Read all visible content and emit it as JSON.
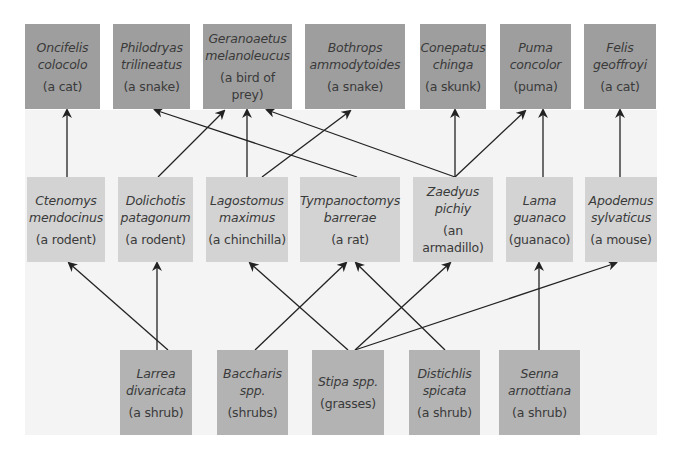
{
  "diagram": {
    "type": "food-web",
    "top_row": [
      {
        "id": "oncifelis",
        "sci1": "Oncifelis",
        "sci2": "colocolo",
        "common": "(a cat)",
        "x": 25,
        "w": 75
      },
      {
        "id": "philodryas",
        "sci1": "Philodryas",
        "sci2": "trilineatus",
        "common": "(a snake)",
        "x": 113,
        "w": 77
      },
      {
        "id": "geranoaetus",
        "sci1": "Geranoaetus",
        "sci2": "melanoleucus",
        "common": "(a bird of prey)",
        "x": 203,
        "w": 89
      },
      {
        "id": "bothrops",
        "sci1": "Bothrops",
        "sci2": "ammodytoides",
        "common": "(a snake)",
        "x": 305,
        "w": 100
      },
      {
        "id": "conepatus",
        "sci1": "Conepatus",
        "sci2": "chinga",
        "common": "(a skunk)",
        "x": 420,
        "w": 66
      },
      {
        "id": "puma",
        "sci1": "Puma",
        "sci2": "concolor",
        "common": "(puma)",
        "x": 500,
        "w": 71
      },
      {
        "id": "felis",
        "sci1": "Felis",
        "sci2": "geoffroyi",
        "common": "(a cat)",
        "x": 584,
        "w": 72
      }
    ],
    "middle_row": [
      {
        "id": "ctenomys",
        "sci1": "Ctenomys",
        "sci2": "mendocinus",
        "common": "(a rodent)",
        "x": 27,
        "w": 78
      },
      {
        "id": "dolichotis",
        "sci1": "Dolichotis",
        "sci2": "patagonum",
        "common": "(a rodent)",
        "x": 118,
        "w": 75
      },
      {
        "id": "lagostomus",
        "sci1": "Lagostomus",
        "sci2": "maximus",
        "common": "(a chinchilla)",
        "x": 206,
        "w": 82
      },
      {
        "id": "tympanoctomys",
        "sci1": "Tympanoctomys",
        "sci2": "barrerae",
        "common": "(a rat)",
        "x": 300,
        "w": 100
      },
      {
        "id": "zaedyus",
        "sci1": "Zaedyus",
        "sci2": "pichiy",
        "common": "(an armadillo)",
        "x": 413,
        "w": 80
      },
      {
        "id": "lama",
        "sci1": "Lama",
        "sci2": "guanaco",
        "common": "(guanaco)",
        "x": 506,
        "w": 67
      },
      {
        "id": "apodemus",
        "sci1": "Apodemus",
        "sci2": "sylvaticus",
        "common": "(a mouse)",
        "x": 585,
        "w": 72
      }
    ],
    "bottom_row": [
      {
        "id": "larrea",
        "sci1": "Larrea",
        "sci2": "divaricata",
        "common": "(a shrub)",
        "x": 120,
        "w": 72
      },
      {
        "id": "baccharis",
        "sci1": "Baccharis",
        "sci2": "spp.",
        "common": "(shrubs)",
        "x": 217,
        "w": 71
      },
      {
        "id": "stipa",
        "sci1": "Stipa spp.",
        "sci2": "",
        "common": "(grasses)",
        "x": 312,
        "w": 72
      },
      {
        "id": "distichlis",
        "sci1": "Distichlis",
        "sci2": "spicata",
        "common": "(a shrub)",
        "x": 409,
        "w": 71
      },
      {
        "id": "senna",
        "sci1": "Senna",
        "sci2": "arnottiana",
        "common": "(a shrub)",
        "x": 499,
        "w": 81
      }
    ],
    "edges": [
      {
        "from": "ctenomys",
        "to": "oncifelis"
      },
      {
        "from": "dolichotis",
        "to": "geranoaetus"
      },
      {
        "from": "lagostomus",
        "to": "geranoaetus"
      },
      {
        "from": "lagostomus",
        "to": "bothrops"
      },
      {
        "from": "tympanoctomys",
        "to": "philodryas"
      },
      {
        "from": "zaedyus",
        "to": "geranoaetus"
      },
      {
        "from": "zaedyus",
        "to": "conepatus"
      },
      {
        "from": "zaedyus",
        "to": "puma"
      },
      {
        "from": "lama",
        "to": "puma"
      },
      {
        "from": "apodemus",
        "to": "felis"
      },
      {
        "from": "larrea",
        "to": "ctenomys"
      },
      {
        "from": "larrea",
        "to": "dolichotis"
      },
      {
        "from": "baccharis",
        "to": "tympanoctomys"
      },
      {
        "from": "stipa",
        "to": "lagostomus"
      },
      {
        "from": "stipa",
        "to": "zaedyus"
      },
      {
        "from": "stipa",
        "to": "apodemus"
      },
      {
        "from": "distichlis",
        "to": "tympanoctomys"
      },
      {
        "from": "senna",
        "to": "lama"
      }
    ]
  },
  "colors": {
    "top_box": "#9e9e9e",
    "middle_box": "#d3d3d3",
    "bottom_box": "#b3b3b3",
    "panel": "#f4f4f4",
    "arrow": "#222222",
    "text": "#3a3a3a"
  }
}
